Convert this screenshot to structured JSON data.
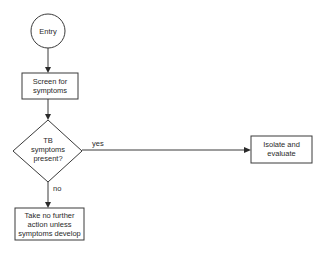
{
  "diagram": {
    "type": "flowchart",
    "nodes": {
      "entry": {
        "shape": "circle",
        "lines": [
          "Entry"
        ]
      },
      "screen": {
        "shape": "rect",
        "lines": [
          "Screen for",
          "symptoms"
        ]
      },
      "decision": {
        "shape": "diamond",
        "lines": [
          "TB",
          "symptoms",
          "present?"
        ]
      },
      "no_action": {
        "shape": "rect",
        "lines": [
          "Take no further",
          "action unless",
          "symptoms develop"
        ]
      },
      "isolate": {
        "shape": "rect",
        "lines": [
          "Isolate and",
          "evaluate"
        ]
      }
    },
    "edges": {
      "entry_to_screen": {
        "from": "entry",
        "to": "screen",
        "label": ""
      },
      "screen_to_decision": {
        "from": "screen",
        "to": "decision",
        "label": ""
      },
      "decision_yes": {
        "from": "decision",
        "to": "isolate",
        "label": "yes"
      },
      "decision_no": {
        "from": "decision",
        "to": "no_action",
        "label": "no"
      }
    }
  }
}
